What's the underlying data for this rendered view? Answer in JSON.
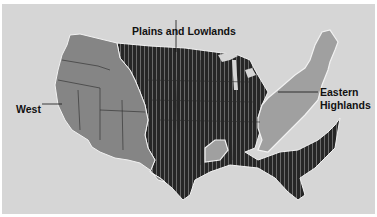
{
  "map": {
    "title": "Physiographic regions of the contiguous United States",
    "colors": {
      "background": "#d6d6d6",
      "west": "#858585",
      "plains": "#262626",
      "plains_stripe": "#6a6a6a",
      "eastern": "#a0a0a0",
      "border_line": "#2a2a2a",
      "outline": "#f2f2f2"
    },
    "labels": {
      "plains": "Plains and Lowlands",
      "west": "West",
      "eastern_line1": "Eastern",
      "eastern_line2": "Highlands"
    },
    "regions": [
      {
        "name": "West",
        "fill": "gray"
      },
      {
        "name": "Plains and Lowlands",
        "fill": "dark striped"
      },
      {
        "name": "Eastern Highlands",
        "fill": "light gray"
      }
    ]
  }
}
